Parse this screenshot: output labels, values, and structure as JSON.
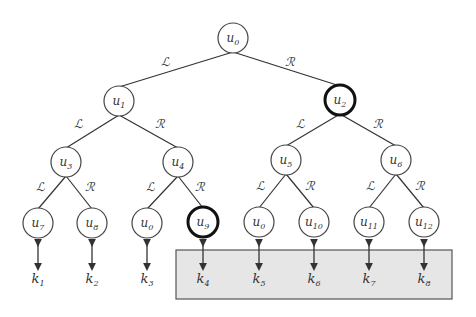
{
  "diagram": {
    "type": "binary-tree",
    "colors": {
      "edge": "#333333",
      "node_stroke": "#444444",
      "highlight_stroke": "#111111",
      "box_fill": "#e6e6e6",
      "box_stroke": "#555555"
    },
    "edge_labels": {
      "left": "ℒ",
      "right": "ℛ"
    },
    "nodes": [
      {
        "id": "u0_root",
        "base": "u",
        "sub": "0",
        "x": 233,
        "y": 38,
        "highlight": false
      },
      {
        "id": "u1",
        "base": "u",
        "sub": "1",
        "x": 119,
        "y": 101,
        "highlight": false
      },
      {
        "id": "u2",
        "base": "u",
        "sub": "2",
        "x": 340,
        "y": 100,
        "highlight": true
      },
      {
        "id": "u3",
        "base": "u",
        "sub": "3",
        "x": 66,
        "y": 162,
        "highlight": false
      },
      {
        "id": "u4",
        "base": "u",
        "sub": "4",
        "x": 178,
        "y": 162,
        "highlight": false
      },
      {
        "id": "u5",
        "base": "u",
        "sub": "5",
        "x": 286,
        "y": 160,
        "highlight": false
      },
      {
        "id": "u6",
        "base": "u",
        "sub": "6",
        "x": 396,
        "y": 160,
        "highlight": false
      },
      {
        "id": "u7",
        "base": "u",
        "sub": "7",
        "x": 38,
        "y": 223,
        "highlight": false
      },
      {
        "id": "u8",
        "base": "u",
        "sub": "8",
        "x": 92,
        "y": 223,
        "highlight": false
      },
      {
        "id": "u0_leaf_a",
        "base": "u",
        "sub": "0",
        "x": 147,
        "y": 223,
        "highlight": false
      },
      {
        "id": "u9",
        "base": "u",
        "sub": "9",
        "x": 203,
        "y": 222,
        "highlight": true
      },
      {
        "id": "u0_leaf_b",
        "base": "u",
        "sub": "0",
        "x": 259,
        "y": 222,
        "highlight": false
      },
      {
        "id": "u10",
        "base": "u",
        "sub": "10",
        "x": 314,
        "y": 222,
        "highlight": false
      },
      {
        "id": "u11",
        "base": "u",
        "sub": "11",
        "x": 369,
        "y": 222,
        "highlight": false
      },
      {
        "id": "u12",
        "base": "u",
        "sub": "12",
        "x": 424,
        "y": 222,
        "highlight": false
      }
    ],
    "edges": [
      {
        "from": 0,
        "to": 1,
        "label": "ℒ",
        "lx": 165,
        "ly": 66
      },
      {
        "from": 0,
        "to": 2,
        "label": "ℛ",
        "lx": 290,
        "ly": 66
      },
      {
        "from": 1,
        "to": 3,
        "label": "ℒ",
        "lx": 78,
        "ly": 128
      },
      {
        "from": 1,
        "to": 4,
        "label": "ℛ",
        "lx": 160,
        "ly": 128
      },
      {
        "from": 2,
        "to": 5,
        "label": "ℒ",
        "lx": 300,
        "ly": 128
      },
      {
        "from": 2,
        "to": 6,
        "label": "ℛ",
        "lx": 378,
        "ly": 128
      },
      {
        "from": 3,
        "to": 7,
        "label": "ℒ",
        "lx": 40,
        "ly": 191
      },
      {
        "from": 3,
        "to": 8,
        "label": "ℛ",
        "lx": 90,
        "ly": 191
      },
      {
        "from": 4,
        "to": 9,
        "label": "ℒ",
        "lx": 150,
        "ly": 191
      },
      {
        "from": 4,
        "to": 10,
        "label": "ℛ",
        "lx": 200,
        "ly": 191
      },
      {
        "from": 5,
        "to": 11,
        "label": "ℒ",
        "lx": 260,
        "ly": 190
      },
      {
        "from": 5,
        "to": 12,
        "label": "ℛ",
        "lx": 310,
        "ly": 190
      },
      {
        "from": 6,
        "to": 13,
        "label": "ℒ",
        "lx": 370,
        "ly": 190
      },
      {
        "from": 6,
        "to": 14,
        "label": "ℛ",
        "lx": 420,
        "ly": 190
      }
    ],
    "keys": [
      {
        "base": "k",
        "sub": "1",
        "x": 38
      },
      {
        "base": "k",
        "sub": "2",
        "x": 92
      },
      {
        "base": "k",
        "sub": "3",
        "x": 147
      },
      {
        "base": "k",
        "sub": "4",
        "x": 203
      },
      {
        "base": "k",
        "sub": "5",
        "x": 259
      },
      {
        "base": "k",
        "sub": "6",
        "x": 314
      },
      {
        "base": "k",
        "sub": "7",
        "x": 369
      },
      {
        "base": "k",
        "sub": "8",
        "x": 424
      }
    ],
    "highlight_box": {
      "x": 176,
      "y": 250,
      "width": 276,
      "height": 49
    }
  }
}
